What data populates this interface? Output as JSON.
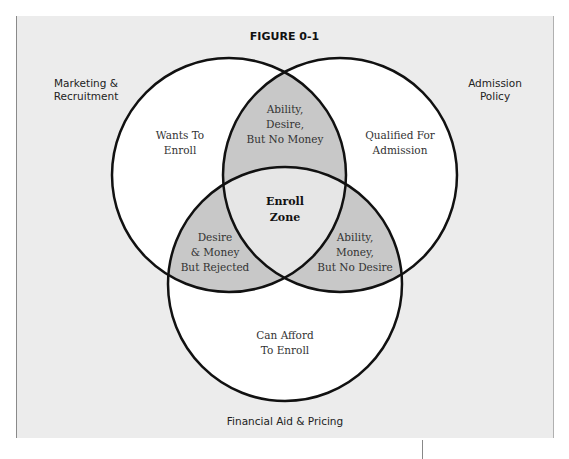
{
  "figure": {
    "title": "FIGURE 0-1"
  },
  "colors": {
    "background": "#ececec",
    "circle_fill": "#ffffff",
    "pair_overlap_fill": "#c8c8c8",
    "center_fill": "#e6e6e6",
    "stroke": "#111111"
  },
  "sets": [
    {
      "id": "marketing",
      "label": "Marketing &\nRecruitment",
      "region_label": "Wants To\nEnroll"
    },
    {
      "id": "admission",
      "label": "Admission\nPolicy",
      "region_label": "Qualified For\nAdmission"
    },
    {
      "id": "financial",
      "label": "Financial Aid & Pricing",
      "region_label": "Can Afford\nTo Enroll"
    }
  ],
  "overlaps": {
    "marketing_admission": "Ability,\nDesire,\nBut No Money",
    "marketing_financial": "Desire\n& Money\nBut Rejected",
    "admission_financial": "Ability,\nMoney,\nBut No Desire",
    "all": "Enroll\nZone"
  }
}
